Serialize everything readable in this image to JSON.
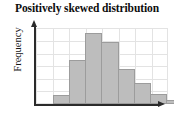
{
  "chart_data": {
    "type": "bar",
    "title": "Positively skewed distribution",
    "xlabel": "",
    "ylabel": "Frequency",
    "categories": [
      "1",
      "2",
      "3",
      "4",
      "5",
      "6",
      "7",
      "8"
    ],
    "values": [
      1,
      5,
      8,
      7,
      4,
      2.4,
      1.1,
      0.5
    ],
    "ylim": [
      0,
      8.6
    ],
    "grid": true,
    "grid_x_count": 8,
    "grid_y_count": 6,
    "legend": null,
    "legend_position": "none",
    "bar_fill_color": "#bdbdbd",
    "bar_edge_color": "#9c9c9c",
    "grid_color": "#e3e3e3",
    "axis_color": "#2b2b2b",
    "background_color": "#ffffff",
    "axis_arrows": {
      "x": "arrow-right",
      "y": "arrow-up"
    },
    "tick_labels_x": [],
    "tick_labels_y": [],
    "annotations": []
  }
}
